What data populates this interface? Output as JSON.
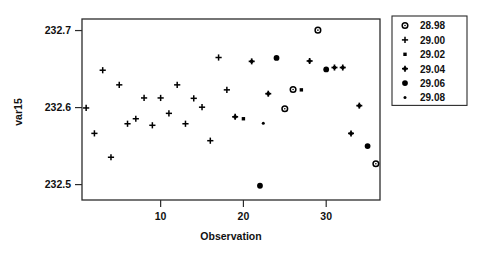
{
  "chart_data": {
    "type": "scatter",
    "title": "",
    "xlabel": "Observation",
    "ylabel": "var15",
    "xlim": [
      0.5,
      36.5
    ],
    "ylim": [
      232.48,
      232.715
    ],
    "xticks": [
      10,
      20,
      30
    ],
    "xtick_labels": [
      "10",
      "20",
      "30"
    ],
    "yticks": [
      232.5,
      232.6,
      232.7
    ],
    "ytick_labels": [
      "232.5",
      "232.6",
      "232.7"
    ],
    "grid": false,
    "legend_position": "right",
    "legend_title": "",
    "legend": [
      {
        "label": "28.98",
        "marker": "open-circle-dot"
      },
      {
        "label": "29.00",
        "marker": "plus"
      },
      {
        "label": "29.02",
        "marker": "small-square"
      },
      {
        "label": "29.04",
        "marker": "filled-plus-dot"
      },
      {
        "label": "29.06",
        "marker": "filled-circle"
      },
      {
        "label": "29.08",
        "marker": "small-dot"
      }
    ],
    "series": [
      {
        "name": "29.00",
        "marker": "plus",
        "points": [
          {
            "x": 1,
            "y": 232.5995
          },
          {
            "x": 2,
            "y": 232.5665
          },
          {
            "x": 3,
            "y": 232.6485
          },
          {
            "x": 4,
            "y": 232.5355
          },
          {
            "x": 5,
            "y": 232.6295
          },
          {
            "x": 6,
            "y": 232.579
          },
          {
            "x": 7,
            "y": 232.5855
          },
          {
            "x": 8,
            "y": 232.6125
          },
          {
            "x": 9,
            "y": 232.577
          },
          {
            "x": 10,
            "y": 232.6125
          },
          {
            "x": 11,
            "y": 232.5925
          },
          {
            "x": 12,
            "y": 232.6295
          },
          {
            "x": 13,
            "y": 232.579
          },
          {
            "x": 14,
            "y": 232.612
          },
          {
            "x": 15,
            "y": 232.6005
          },
          {
            "x": 16,
            "y": 232.557
          },
          {
            "x": 17,
            "y": 232.665
          },
          {
            "x": 18,
            "y": 232.623
          }
        ]
      },
      {
        "name": "29.04",
        "marker": "filled-plus-dot",
        "points": [
          {
            "x": 19,
            "y": 232.588
          },
          {
            "x": 21,
            "y": 232.66
          },
          {
            "x": 23,
            "y": 232.618
          },
          {
            "x": 28,
            "y": 232.6605
          },
          {
            "x": 31,
            "y": 232.652
          },
          {
            "x": 32,
            "y": 232.652
          },
          {
            "x": 33,
            "y": 232.5665
          },
          {
            "x": 34,
            "y": 232.6025
          }
        ]
      },
      {
        "name": "29.02",
        "marker": "small-square",
        "points": [
          {
            "x": 20,
            "y": 232.5855
          },
          {
            "x": 27,
            "y": 232.623
          }
        ]
      },
      {
        "name": "29.06",
        "marker": "filled-circle",
        "points": [
          {
            "x": 22,
            "y": 232.4985
          },
          {
            "x": 24,
            "y": 232.6645
          },
          {
            "x": 30,
            "y": 232.6495
          },
          {
            "x": 35,
            "y": 232.55
          }
        ]
      },
      {
        "name": "28.98",
        "marker": "open-circle-dot",
        "points": [
          {
            "x": 25,
            "y": 232.5985
          },
          {
            "x": 26,
            "y": 232.6235
          },
          {
            "x": 29,
            "y": 232.7005
          },
          {
            "x": 36,
            "y": 232.527
          }
        ]
      },
      {
        "name": "29.08",
        "marker": "small-dot",
        "points": [
          {
            "x": 22.4,
            "y": 232.5795
          }
        ]
      }
    ]
  }
}
